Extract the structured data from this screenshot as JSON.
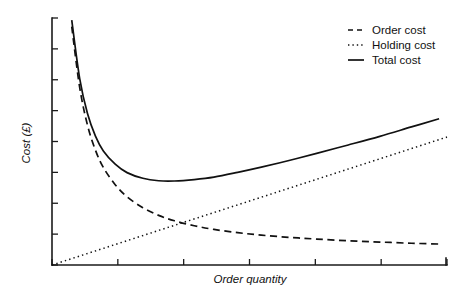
{
  "chart_data": {
    "type": "line",
    "title": "",
    "xlabel": "Order quantity",
    "ylabel": "Cost (£)",
    "grid": false,
    "legend_position": "top-right",
    "xlim": [
      0,
      100
    ],
    "ylim": [
      0,
      100
    ],
    "x_tick_labels": [],
    "y_tick_labels": [],
    "x_tick_count": 7,
    "y_tick_count": 9,
    "annotations": [],
    "series": [
      {
        "name": "Order cost",
        "style": "dashed",
        "color": "#111111",
        "x": [
          5,
          7,
          9,
          11,
          13,
          16,
          19,
          23,
          27,
          31,
          36,
          41,
          47,
          53,
          60,
          67,
          75,
          83,
          91,
          98
        ],
        "values": [
          96.5,
          72.0,
          56.5,
          46.5,
          39.5,
          32.5,
          27.6,
          23.2,
          20.1,
          17.9,
          15.9,
          14.4,
          13.1,
          12.1,
          11.2,
          10.5,
          9.8,
          9.3,
          8.8,
          8.5
        ]
      },
      {
        "name": "Holding cost",
        "style": "dotted",
        "color": "#111111",
        "x": [
          0,
          100
        ],
        "values": [
          0,
          51.8
        ]
      },
      {
        "name": "Total cost",
        "style": "solid",
        "color": "#111111",
        "x": [
          5,
          7,
          9,
          11,
          13,
          16,
          19,
          23,
          27,
          31,
          36,
          41,
          47,
          53,
          60,
          67,
          75,
          83,
          91,
          98
        ],
        "values": [
          99.1,
          75.6,
          61.2,
          52.2,
          46.2,
          40.8,
          37.4,
          35.1,
          34.1,
          34.0,
          34.6,
          35.6,
          37.5,
          39.6,
          42.3,
          45.2,
          48.6,
          52.1,
          55.9,
          59.2
        ]
      }
    ]
  },
  "legend": {
    "items": [
      {
        "label": "Order cost",
        "marker": "dashed-line-icon"
      },
      {
        "label": "Holding cost",
        "marker": "dotted-line-icon"
      },
      {
        "label": "Total cost",
        "marker": "solid-line-icon"
      }
    ]
  },
  "axes": {
    "x_title": "Order quantity",
    "y_title": "Cost (£)"
  }
}
